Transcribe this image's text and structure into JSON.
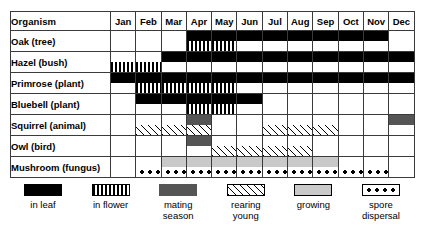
{
  "table": {
    "organism_header": "Organism",
    "months": [
      "Jan",
      "Feb",
      "Mar",
      "Apr",
      "May",
      "Jun",
      "Jul",
      "Aug",
      "Sep",
      "Oct",
      "Nov",
      "Dec"
    ],
    "rows": [
      {
        "name": "Oak (tree)",
        "bands": {
          "top": [
            "",
            "",
            "",
            "in leaf",
            "in leaf",
            "in leaf",
            "in leaf",
            "in leaf",
            "in leaf",
            "in leaf",
            "in leaf",
            ""
          ],
          "bottom": [
            "",
            "",
            "",
            "in flower",
            "in flower",
            "",
            "",
            "",
            "",
            "",
            "",
            ""
          ]
        }
      },
      {
        "name": "Hazel (bush)",
        "bands": {
          "top": [
            "",
            "",
            "in leaf",
            "in leaf",
            "in leaf",
            "in leaf",
            "in leaf",
            "in leaf",
            "in leaf",
            "in leaf",
            "in leaf",
            "in leaf"
          ],
          "bottom": [
            "in flower",
            "in flower",
            "",
            "",
            "",
            "",
            "",
            "",
            "",
            "",
            "",
            ""
          ]
        }
      },
      {
        "name": "Primrose (plant)",
        "bands": {
          "top": [
            "in leaf",
            "in leaf",
            "in leaf",
            "in leaf",
            "in leaf",
            "in leaf",
            "in leaf",
            "in leaf",
            "in leaf",
            "in leaf",
            "in leaf",
            "in leaf"
          ],
          "bottom": [
            "",
            "in flower",
            "in flower",
            "in flower",
            "in flower",
            "",
            "",
            "",
            "",
            "",
            "",
            ""
          ]
        }
      },
      {
        "name": "Bluebell (plant)",
        "bands": {
          "top": [
            "",
            "in leaf",
            "in leaf",
            "in leaf",
            "in leaf",
            "in leaf",
            "",
            "",
            "",
            "",
            "",
            ""
          ],
          "bottom": [
            "",
            "",
            "",
            "in flower",
            "in flower",
            "",
            "",
            "",
            "",
            "",
            "",
            ""
          ]
        }
      },
      {
        "name": "Squirrel (animal)",
        "bands": {
          "top": [
            "",
            "",
            "",
            "mating season",
            "",
            "",
            "",
            "",
            "",
            "",
            "",
            "mating season"
          ],
          "bottom": [
            "",
            "rearing young",
            "rearing young",
            "rearing young",
            "",
            "",
            "rearing young",
            "rearing young",
            "rearing young",
            "",
            "",
            ""
          ]
        }
      },
      {
        "name": "Owl (bird)",
        "bands": {
          "top": [
            "",
            "",
            "",
            "mating season",
            "",
            "",
            "",
            "",
            "",
            "",
            "",
            ""
          ],
          "bottom": [
            "",
            "",
            "",
            "",
            "rearing young",
            "rearing young",
            "rearing young",
            "rearing young",
            "",
            "",
            "",
            ""
          ]
        }
      },
      {
        "name": "Mushroom (fungus)",
        "bands": {
          "top": [
            "",
            "",
            "growing",
            "growing",
            "growing",
            "growing",
            "growing",
            "growing",
            "growing",
            "",
            "",
            ""
          ],
          "bottom": [
            "",
            "spore dispersal",
            "spore dispersal",
            "spore dispersal",
            "spore dispersal",
            "spore dispersal",
            "spore dispersal",
            "spore dispersal",
            "spore dispersal",
            "spore dispersal",
            "spore dispersal",
            ""
          ]
        }
      }
    ]
  },
  "legend": {
    "items": [
      {
        "key": "in leaf",
        "label": "in leaf"
      },
      {
        "key": "in flower",
        "label": "in flower"
      },
      {
        "key": "mating season",
        "label": "mating\nseason"
      },
      {
        "key": "rearing young",
        "label": "rearing\nyoung"
      },
      {
        "key": "growing",
        "label": "growing"
      },
      {
        "key": "spore dispersal",
        "label": "spore\ndispersal"
      }
    ]
  },
  "colors": {
    "in leaf": "#000000",
    "mating season": "#555555",
    "growing": "#c9c9c9",
    "border": "#000000"
  }
}
